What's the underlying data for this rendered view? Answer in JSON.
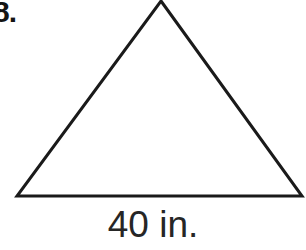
{
  "figure": {
    "problem_number": "8.",
    "base_label": "40 in.",
    "shape_name": "triangle",
    "stroke_color": "#1a1a1a",
    "text_color": "#262626",
    "background_color": "#ffffff",
    "stroke_width": 3,
    "vertices": {
      "apex": [
        161,
        1
      ],
      "bottom_left": [
        17,
        196
      ],
      "bottom_right": [
        302,
        196
      ]
    },
    "polygon_points": "161,1 302,196 17,196"
  }
}
